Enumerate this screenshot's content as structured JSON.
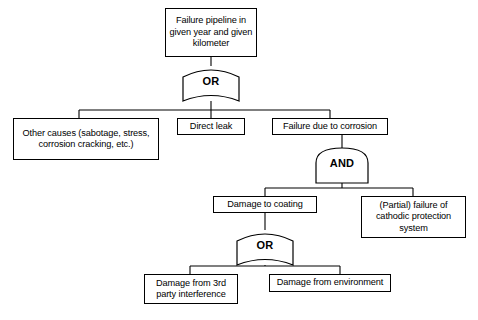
{
  "diagram": {
    "type": "fault-tree",
    "background_color": "#ffffff",
    "line_color": "#000000",
    "text_color": "#000000",
    "nodes": [
      {
        "id": "top-event",
        "label": "Failure pipeline in given year and given kilometer",
        "kind": "event-box",
        "level": 0
      },
      {
        "id": "other-causes",
        "label": "Other causes (sabotage, stress, corrosion cracking, etc.)",
        "kind": "event-box",
        "level": 1
      },
      {
        "id": "direct-leak",
        "label": "Direct leak",
        "kind": "event-box",
        "level": 1
      },
      {
        "id": "failure-corrosion",
        "label": "Failure due to corrosion",
        "kind": "event-box",
        "level": 1
      },
      {
        "id": "damage-coating",
        "label": "Damage to coating",
        "kind": "event-box",
        "level": 2
      },
      {
        "id": "cathodic-failure",
        "label": "(Partial) failure of cathodic protection system",
        "kind": "event-box",
        "level": 2
      },
      {
        "id": "damage-third-party",
        "label": "Damage from 3rd party interference",
        "kind": "event-box",
        "level": 3
      },
      {
        "id": "damage-environment",
        "label": "Damage from environment",
        "kind": "event-box",
        "level": 3
      }
    ],
    "gates": [
      {
        "id": "gate-top-or",
        "label": "OR",
        "kind": "or-gate",
        "parent": "top-event",
        "children": [
          "other-causes",
          "direct-leak",
          "failure-corrosion"
        ]
      },
      {
        "id": "gate-corrosion-and",
        "label": "AND",
        "kind": "and-gate",
        "parent": "failure-corrosion",
        "children": [
          "damage-coating",
          "cathodic-failure"
        ]
      },
      {
        "id": "gate-coating-or",
        "label": "OR",
        "kind": "or-gate",
        "parent": "damage-coating",
        "children": [
          "damage-third-party",
          "damage-environment"
        ]
      }
    ]
  }
}
